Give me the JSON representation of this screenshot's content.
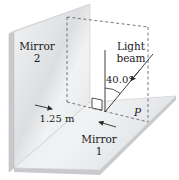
{
  "diagram": {
    "type": "physics-optics-two-mirrors",
    "labels": {
      "mirror2_line1": "Mirror",
      "mirror2_line2": "2",
      "mirror1_line1": "Mirror",
      "mirror1_line2": "1",
      "beam_line1": "Light",
      "beam_line2": "beam",
      "angle": "40.0°",
      "distance": "1.25 m",
      "point": "P"
    },
    "colors": {
      "mirror_face": "#e9eaec",
      "mirror_edge": "#c9cacd",
      "floor_face": "#ececee",
      "line": "#2a2a2a",
      "dashed": "#555555",
      "background": "#ffffff"
    }
  }
}
